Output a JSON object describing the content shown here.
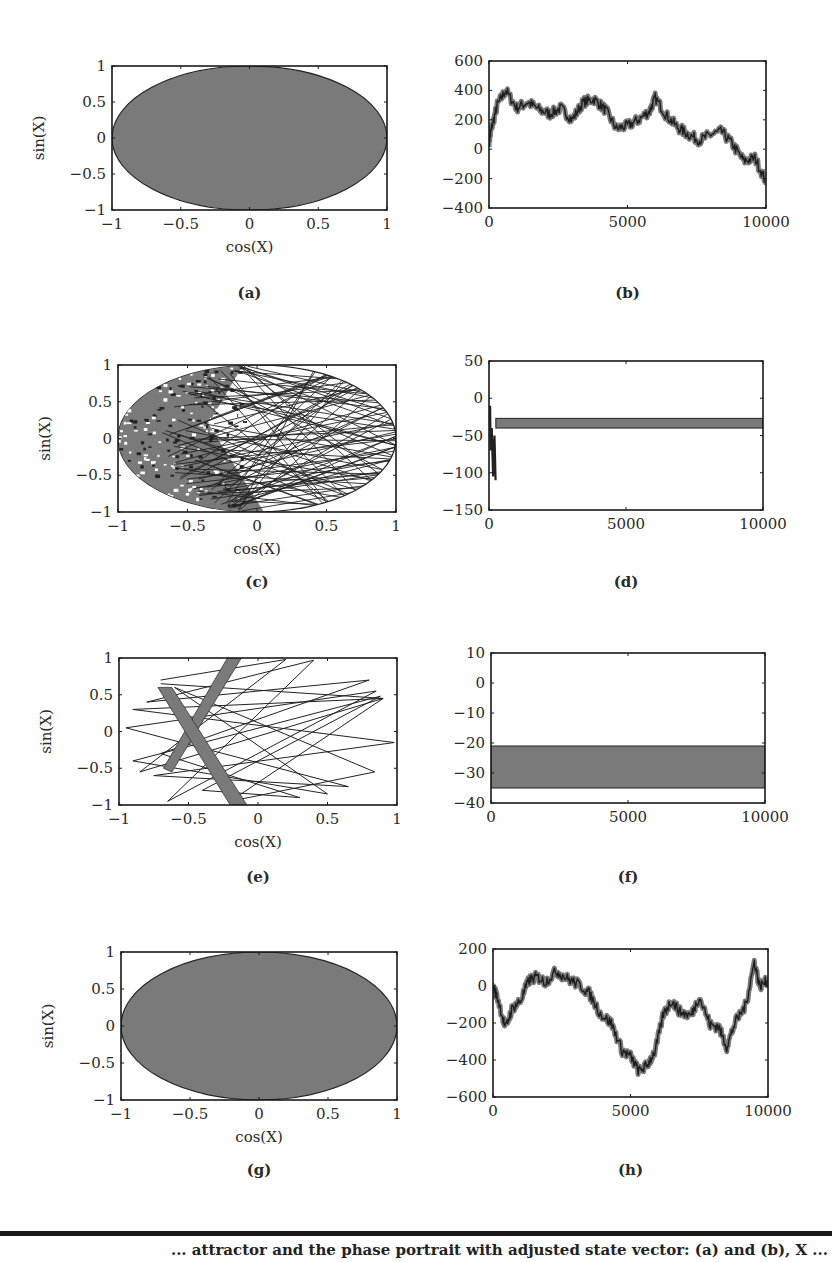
{
  "figure": {
    "caption_fragment": "... attractor and the phase portrait with adjusted state vector: (a) and (b), X ...",
    "colors": {
      "fill": "#7a7a7a",
      "line": "#222222",
      "axis": "#1a1a1a",
      "background": "#ffffff"
    }
  },
  "chart_data": [
    {
      "id": "a",
      "panel_label": "(a)",
      "type": "scatter",
      "title": "",
      "xlabel": "cos(X)",
      "ylabel": "sin(X)",
      "xlim": [
        -1,
        1
      ],
      "ylim": [
        -1,
        1
      ],
      "xticks": [
        "−1",
        "−0.5",
        "0",
        "0.5",
        "1"
      ],
      "yticks": [
        "1",
        "0.5",
        "0",
        "−0.5",
        "−1"
      ],
      "description": "Dense filled unit circle (stretched into an ellipse by aspect ratio); points densely cover the entire disk",
      "grid": false
    },
    {
      "id": "b",
      "panel_label": "(b)",
      "type": "line",
      "title": "",
      "xlabel": "",
      "ylabel": "",
      "xlim": [
        0,
        10000
      ],
      "ylim": [
        -400,
        600
      ],
      "xticks": [
        "0",
        "5000",
        "10000"
      ],
      "yticks": [
        "600",
        "400",
        "200",
        "0",
        "−200",
        "−400"
      ],
      "x": [
        0,
        100,
        300,
        600,
        1000,
        1400,
        1800,
        2200,
        2600,
        3000,
        3400,
        3800,
        4200,
        4600,
        5000,
        5400,
        5800,
        6000,
        6400,
        6800,
        7200,
        7600,
        8000,
        8400,
        8800,
        9200,
        9600,
        10000
      ],
      "values": [
        50,
        150,
        300,
        400,
        280,
        320,
        270,
        240,
        280,
        200,
        320,
        340,
        270,
        140,
        160,
        200,
        260,
        350,
        230,
        150,
        100,
        60,
        100,
        120,
        30,
        -80,
        -60,
        -220
      ],
      "grid": false
    },
    {
      "id": "c",
      "panel_label": "(c)",
      "type": "scatter",
      "title": "",
      "xlabel": "cos(X)",
      "ylabel": "sin(X)",
      "xlim": [
        -1,
        1
      ],
      "ylim": [
        -1,
        1
      ],
      "xticks": [
        "−1",
        "−0.5",
        "0",
        "0.5",
        "1"
      ],
      "yticks": [
        "1",
        "0.5",
        "0",
        "−0.5",
        "−1"
      ],
      "description": "Disk densely filled on left half with many chord line segments across the right half",
      "grid": false
    },
    {
      "id": "d",
      "panel_label": "(d)",
      "type": "line",
      "title": "",
      "xlabel": "",
      "ylabel": "",
      "xlim": [
        0,
        10000
      ],
      "ylim": [
        -150,
        50
      ],
      "xticks": [
        "0",
        "5000",
        "10000"
      ],
      "yticks": [
        "50",
        "0",
        "−50",
        "−100",
        "−150"
      ],
      "transient": {
        "x_range": [
          0,
          250
        ],
        "y_range": [
          -110,
          -10
        ]
      },
      "band": {
        "x_range": [
          250,
          10000
        ],
        "y_range": [
          -40,
          -27
        ]
      },
      "grid": false
    },
    {
      "id": "e",
      "panel_label": "(e)",
      "type": "scatter",
      "title": "",
      "xlabel": "cos(X)",
      "ylabel": "sin(X)",
      "xlim": [
        -1,
        1
      ],
      "ylim": [
        -1,
        1
      ],
      "xticks": [
        "−1",
        "−0.5",
        "0",
        "0.5",
        "1"
      ],
      "yticks": [
        "1",
        "0.5",
        "0",
        "−0.5",
        "−1"
      ],
      "description": "Sparse set of straight chords plus two thick crossing bands forming an X near (-0.5, 0)",
      "grid": false
    },
    {
      "id": "f",
      "panel_label": "(f)",
      "type": "area",
      "title": "",
      "xlabel": "",
      "ylabel": "",
      "xlim": [
        0,
        10000
      ],
      "ylim": [
        -40,
        10
      ],
      "xticks": [
        "0",
        "5000",
        "10000"
      ],
      "yticks": [
        "10",
        "0",
        "−10",
        "−20",
        "−30",
        "−40"
      ],
      "band": {
        "x_range": [
          0,
          10000
        ],
        "y_range": [
          -35,
          -21
        ]
      },
      "grid": false
    },
    {
      "id": "g",
      "panel_label": "(g)",
      "type": "scatter",
      "title": "",
      "xlabel": "cos(X)",
      "ylabel": "sin(X)",
      "xlim": [
        -1,
        1
      ],
      "ylim": [
        -1,
        1
      ],
      "xticks": [
        "−1",
        "−0.5",
        "0",
        "0.5",
        "1"
      ],
      "yticks": [
        "1",
        "0.5",
        "0",
        "−0.5",
        "−1"
      ],
      "description": "Dense filled unit circle (stretched into an ellipse by aspect ratio)",
      "grid": false
    },
    {
      "id": "h",
      "panel_label": "(h)",
      "type": "line",
      "title": "",
      "xlabel": "",
      "ylabel": "",
      "xlim": [
        0,
        10000
      ],
      "ylim": [
        -600,
        200
      ],
      "xticks": [
        "0",
        "5000",
        "10000"
      ],
      "yticks": [
        "200",
        "0",
        "−200",
        "−400",
        "−600"
      ],
      "x": [
        0,
        200,
        450,
        700,
        1000,
        1300,
        1600,
        1900,
        2300,
        2700,
        3100,
        3500,
        3900,
        4300,
        4700,
        5000,
        5300,
        5600,
        5900,
        6200,
        6500,
        6800,
        7200,
        7500,
        7900,
        8200,
        8500,
        8800,
        9200,
        9500,
        9700,
        10000
      ],
      "values": [
        0,
        -80,
        -230,
        -120,
        -80,
        30,
        50,
        20,
        80,
        40,
        10,
        -40,
        -150,
        -200,
        -350,
        -380,
        -460,
        -430,
        -350,
        -150,
        -80,
        -140,
        -160,
        -60,
        -210,
        -220,
        -330,
        -200,
        -100,
        130,
        0,
        30
      ],
      "grid": false
    }
  ]
}
